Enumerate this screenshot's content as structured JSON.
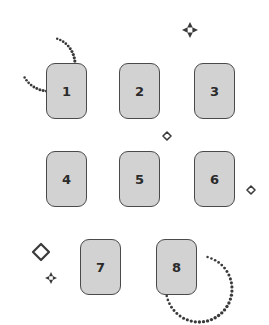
{
  "canvas": {
    "width": 269,
    "height": 325,
    "background": "#ffffff"
  },
  "style": {
    "card_fill": "#d2d2d2",
    "card_border": "#4a4a4a",
    "label_color": "#2b2b2b",
    "decoration_color": "#3a3a3a"
  },
  "cards": [
    {
      "label": "1",
      "x": 46,
      "y": 63,
      "w": 41,
      "h": 56
    },
    {
      "label": "2",
      "x": 119,
      "y": 63,
      "w": 41,
      "h": 56
    },
    {
      "label": "3",
      "x": 194,
      "y": 63,
      "w": 41,
      "h": 56
    },
    {
      "label": "4",
      "x": 46,
      "y": 151,
      "w": 41,
      "h": 56
    },
    {
      "label": "5",
      "x": 119,
      "y": 151,
      "w": 41,
      "h": 56
    },
    {
      "label": "6",
      "x": 194,
      "y": 151,
      "w": 41,
      "h": 56
    },
    {
      "label": "7",
      "x": 80,
      "y": 239,
      "w": 41,
      "h": 56
    },
    {
      "label": "8",
      "x": 156,
      "y": 239,
      "w": 41,
      "h": 56
    }
  ],
  "decorations": {
    "arcs": [
      {
        "name": "dotted-arc-top-left",
        "cx": 48,
        "cy": 64,
        "r": 27,
        "start_deg": -70,
        "end_deg": 150
      },
      {
        "name": "dotted-arc-bottom-right",
        "cx": 199,
        "cy": 289,
        "r": 33,
        "start_deg": -75,
        "end_deg": 175
      }
    ],
    "diamonds": [
      {
        "name": "small-diamond-center",
        "cx": 167,
        "cy": 136,
        "r": 4
      },
      {
        "name": "small-diamond-right",
        "cx": 251,
        "cy": 190,
        "r": 4
      },
      {
        "name": "large-diamond-left",
        "cx": 41,
        "cy": 252,
        "r": 8
      }
    ],
    "sparkles": [
      {
        "name": "sparkle-top",
        "cx": 190,
        "cy": 30,
        "r": 8
      },
      {
        "name": "sparkle-bottom-left",
        "cx": 51,
        "cy": 278,
        "r": 6
      }
    ]
  }
}
